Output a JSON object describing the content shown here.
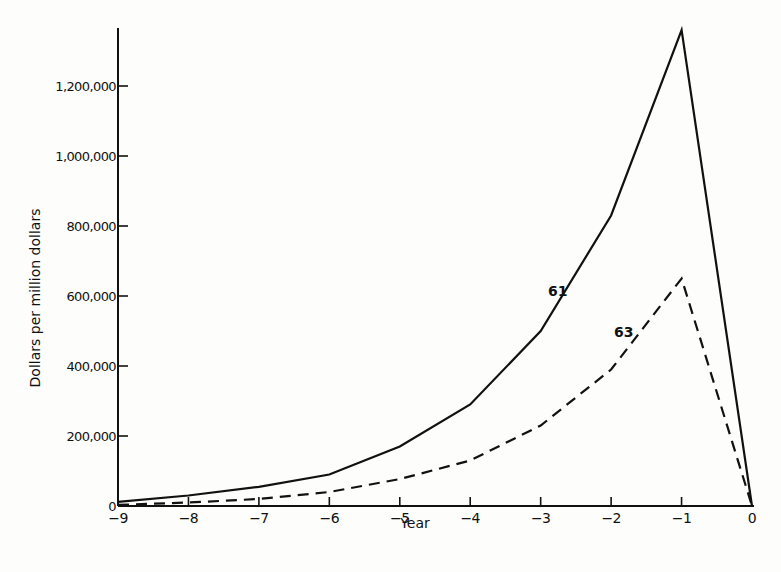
{
  "chart_data": {
    "type": "line",
    "title": "",
    "xlabel": "Year",
    "ylabel": "Dollars per million dollars",
    "x": [
      -9,
      -8,
      -7,
      -6,
      -5,
      -4,
      -3,
      -2,
      -1,
      0
    ],
    "x_tick_labels": [
      "−9",
      "−8",
      "−7",
      "−6",
      "−5",
      "−4",
      "−3",
      "−2",
      "−1",
      "0"
    ],
    "y_ticks": [
      0,
      200000,
      400000,
      600000,
      800000,
      1000000,
      1200000
    ],
    "y_tick_labels": [
      "0",
      "200,000",
      "400,000",
      "600,000",
      "800,000",
      "1,000,000",
      "1,200,000"
    ],
    "xlim": [
      -9,
      0
    ],
    "ylim": [
      0,
      1360000
    ],
    "grid": false,
    "legend": "inline labels",
    "series": [
      {
        "name": "61",
        "style": "solid",
        "values": [
          12000,
          30000,
          55000,
          90000,
          170000,
          290000,
          500000,
          830000,
          1360000,
          0
        ],
        "label_pos": {
          "x": 548,
          "y": 296
        }
      },
      {
        "name": "63",
        "style": "dashed",
        "values": [
          3000,
          10000,
          20000,
          40000,
          77000,
          130000,
          230000,
          390000,
          650000,
          0
        ],
        "label_pos": {
          "x": 614,
          "y": 337
        }
      }
    ]
  }
}
